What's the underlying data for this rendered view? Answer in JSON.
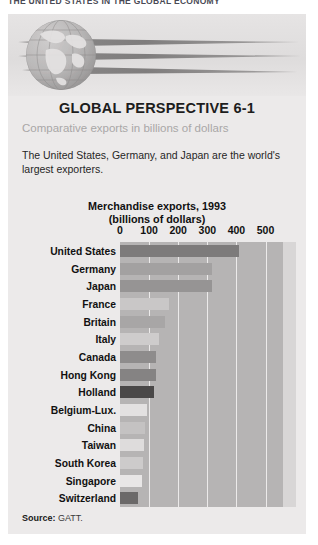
{
  "running_head": "THE UNITED STATES IN THE GLOBAL ECONOMY",
  "panel": {
    "title": "GLOBAL PERSPECTIVE 6-1",
    "subtitle": "Comparative exports in billions of dollars",
    "blurb": "The United States, Germany, and Japan are the world's largest exporters.",
    "banner": {
      "globe_icon": "globe-icon",
      "swoosh_icon": "speed-lines-icon"
    }
  },
  "source": {
    "label": "Source:",
    "value": "GATT."
  },
  "colors": {
    "panel_bg": "#eceaea",
    "plot_bg": "#b6b4b4",
    "plot_tail_bg": "#d8d6d6",
    "gridline": "#eceaea",
    "subtitle": "#a9a7a7",
    "text": "#111111"
  },
  "chart_data": {
    "type": "bar",
    "orientation": "horizontal",
    "title": "Merchandise exports, 1993",
    "subtitle": "(billions of dollars)",
    "xlabel": "",
    "ylabel": "",
    "xlim": [
      0,
      560
    ],
    "xticks": [
      0,
      100,
      200,
      300,
      400,
      500
    ],
    "xtick_labels": [
      "0",
      "100",
      "200",
      "300",
      "400",
      "500"
    ],
    "grid": true,
    "grid_axis": "x",
    "legend": false,
    "source": "GATT",
    "categories": [
      "United States",
      "Germany",
      "Japan",
      "France",
      "Britain",
      "Italy",
      "Canada",
      "Hong Kong",
      "Holland",
      "Belgium-Lux.",
      "China",
      "Taiwan",
      "South Korea",
      "Singapore",
      "Switzerland"
    ],
    "values": [
      410,
      315,
      317,
      170,
      155,
      135,
      125,
      122,
      118,
      92,
      85,
      83,
      80,
      74,
      63
    ],
    "bar_colors": [
      "#7d7b7b",
      "#a3a1a1",
      "#969494",
      "#c9c7c7",
      "#a8a6a6",
      "#cecccc",
      "#8e8c8c",
      "#858383",
      "#4a4848",
      "#e3e1e1",
      "#c4c2c2",
      "#dedcdc",
      "#cdcbcb",
      "#e8e6e6",
      "#6b6969"
    ]
  }
}
